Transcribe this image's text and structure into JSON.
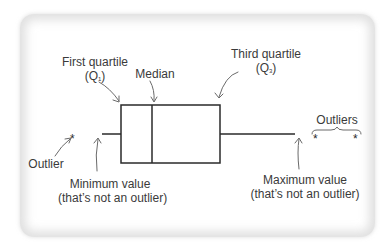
{
  "diagram": {
    "type": "box-plot-anatomy",
    "labels": {
      "first_quartile": "First quartile",
      "first_quartile_symbol": "Q",
      "first_quartile_sub": "1",
      "median": "Median",
      "third_quartile": "Third quartile",
      "third_quartile_symbol": "Q",
      "third_quartile_sub": "3",
      "outliers": "Outliers",
      "outlier": "Outlier",
      "minimum_line1": "Minimum value",
      "minimum_line2": "(that’s not an outlier)",
      "maximum_line1": "Maximum value",
      "maximum_line2": "(that’s not an outlier)"
    },
    "markers": {
      "outlier_symbol": "*"
    },
    "colors": {
      "line": "#2a2a2a",
      "arrow": "#6a6a6a",
      "text": "#3a3a3a",
      "card_edge": "#d0d0d0"
    }
  }
}
